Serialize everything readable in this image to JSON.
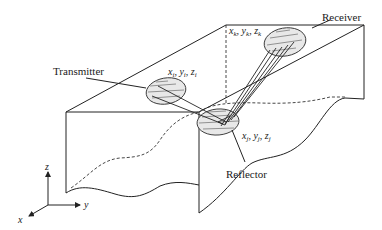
{
  "diagram": {
    "labels": {
      "transmitter": "Transmitter",
      "receiver": "Receiver",
      "reflector": "Reflector"
    },
    "coordinates": {
      "transmitter": {
        "x": "x",
        "xs": "i",
        "y": "y",
        "ys": "i",
        "z": "z",
        "zs": "i"
      },
      "receiver": {
        "x": "x",
        "xs": "k",
        "y": "y",
        "ys": "k",
        "z": "z",
        "zs": "k"
      },
      "reflector": {
        "x": "x",
        "xs": "j",
        "y": "y",
        "ys": "j",
        "z": "z",
        "zs": "j"
      }
    },
    "axes": {
      "x": "x",
      "y": "y",
      "z": "z"
    },
    "colors": {
      "line": "#222222",
      "background": "#ffffff",
      "patch_fill": "#e8e8e8"
    }
  }
}
